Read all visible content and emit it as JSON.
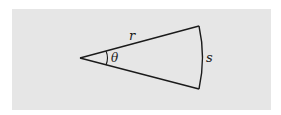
{
  "diagram": {
    "type": "circular-sector",
    "labels": {
      "radius": "r",
      "angle": "θ",
      "arc": "s"
    },
    "colors": {
      "background": "#e6e6e6",
      "stroke": "#1a1a1a"
    }
  }
}
